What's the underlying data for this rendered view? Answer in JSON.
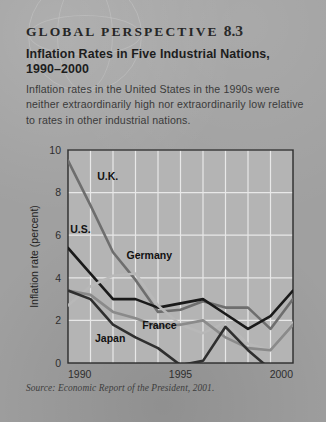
{
  "box": {
    "header_label": "GLOBAL PERSPECTIVE",
    "header_number": "8.3",
    "title": "Inflation Rates in Five Industrial Nations, 1990–2000",
    "body": "Inflation rates in the United States in the 1990s were neither extraordinarily high nor extraordinarily low relative to rates in other industrial nations.",
    "source": "Source: Economic Report of the President, 2001.",
    "background_color": "#a0a0a0",
    "plot_background_color": "#b4b4b4"
  },
  "chart_data": {
    "type": "line",
    "title": "Inflation Rates in Five Industrial Nations, 1990–2000",
    "xlabel": "",
    "ylabel": "Inflation rate (percent)",
    "xlim": [
      1990,
      2000
    ],
    "ylim": [
      0,
      10
    ],
    "xticks": [
      1990,
      1995,
      2000
    ],
    "xtick_labels": [
      "1990",
      "1995",
      "2000"
    ],
    "yticks": [
      0,
      2,
      4,
      6,
      8,
      10
    ],
    "ytick_labels": [
      "0",
      "2",
      "4",
      "6",
      "8",
      "10"
    ],
    "grid": true,
    "grid_color": "#e8e8e8",
    "legend": "inline-labels",
    "x": [
      1990,
      1991,
      1992,
      1993,
      1994,
      1995,
      1996,
      1997,
      1998,
      1999,
      2000
    ],
    "series": [
      {
        "name": "U.K.",
        "color": "#6e6e6e",
        "label_x": 1991.3,
        "label_y": 8.6,
        "values": [
          9.5,
          7.4,
          5.2,
          3.9,
          2.4,
          2.5,
          2.9,
          2.6,
          2.6,
          1.6,
          3.0
        ]
      },
      {
        "name": "U.S.",
        "color": "#1a1a1a",
        "label_x": 1990.1,
        "label_y": 6.1,
        "values": [
          5.4,
          4.2,
          3.0,
          3.0,
          2.6,
          2.8,
          3.0,
          2.3,
          1.6,
          2.2,
          3.4
        ]
      },
      {
        "name": "Germany",
        "color": "#b8b8b8",
        "label_x": 1992.6,
        "label_y": 4.9,
        "values": [
          2.7,
          3.6,
          4.1,
          4.2,
          2.7,
          1.8,
          1.4,
          1.9,
          0.9,
          0.6,
          1.9
        ]
      },
      {
        "name": "France",
        "color": "#8a8a8a",
        "label_x": 1993.3,
        "label_y": 1.6,
        "values": [
          3.4,
          3.2,
          2.4,
          2.1,
          1.7,
          1.8,
          2.0,
          1.2,
          0.7,
          0.6,
          1.8
        ]
      },
      {
        "name": "Japan",
        "color": "#2f2f2f",
        "label_x": 1991.2,
        "label_y": 1.0,
        "values": [
          3.4,
          3.0,
          1.8,
          1.2,
          0.7,
          -0.1,
          0.1,
          1.7,
          0.6,
          -0.3,
          -0.7
        ]
      }
    ]
  }
}
